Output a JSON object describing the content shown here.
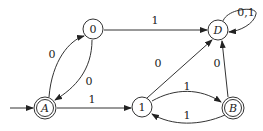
{
  "diagram": {
    "type": "finite-automaton",
    "nodes": [
      {
        "id": "A",
        "label": "A",
        "italic": true,
        "accepting": true,
        "initial": true
      },
      {
        "id": "0",
        "label": "0",
        "italic": false,
        "accepting": false,
        "initial": false
      },
      {
        "id": "D",
        "label": "D",
        "italic": true,
        "accepting": false,
        "initial": false
      },
      {
        "id": "1",
        "label": "1",
        "italic": false,
        "accepting": false,
        "initial": false
      },
      {
        "id": "B",
        "label": "B",
        "italic": true,
        "accepting": true,
        "initial": false
      }
    ],
    "edges": [
      {
        "from": "A",
        "to": "0",
        "label": "0"
      },
      {
        "from": "0",
        "to": "A",
        "label": "0"
      },
      {
        "from": "0",
        "to": "D",
        "label": "1"
      },
      {
        "from": "A",
        "to": "1",
        "label": "1"
      },
      {
        "from": "1",
        "to": "D",
        "label": "0"
      },
      {
        "from": "1",
        "to": "B",
        "label": "1"
      },
      {
        "from": "B",
        "to": "1",
        "label": "1"
      },
      {
        "from": "B",
        "to": "D",
        "label": "0"
      },
      {
        "from": "D",
        "to": "D",
        "label": "0,1"
      }
    ]
  }
}
